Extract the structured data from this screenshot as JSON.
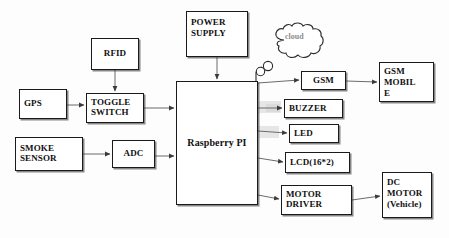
{
  "diagram": {
    "type": "block-diagram",
    "colors": {
      "stroke": "#1a1a1a",
      "wire": "#6b6b6b",
      "cloud_text": "#8d8d8d",
      "background": "#ffffff"
    },
    "nodes": [
      {
        "id": "gps",
        "label": "GPS",
        "x": 19,
        "y": 89,
        "w": 48,
        "h": 30,
        "font": 9,
        "align": "left"
      },
      {
        "id": "rfid",
        "label": "RFID",
        "x": 91,
        "y": 38,
        "w": 48,
        "h": 32,
        "font": 9,
        "align": "center"
      },
      {
        "id": "toggle",
        "label": "TOGGLE\nSWITCH",
        "x": 86,
        "y": 93,
        "w": 58,
        "h": 30,
        "font": 9,
        "align": "left"
      },
      {
        "id": "smoke",
        "label": "SMOKE\nSENSOR",
        "x": 15,
        "y": 137,
        "w": 68,
        "h": 34,
        "font": 9,
        "align": "left"
      },
      {
        "id": "adc",
        "label": "ADC",
        "x": 112,
        "y": 140,
        "w": 43,
        "h": 28,
        "font": 9,
        "align": "center"
      },
      {
        "id": "power",
        "label": "POWER\nSUPPLY",
        "x": 186,
        "y": 11,
        "w": 62,
        "h": 46,
        "font": 9,
        "align": "left"
      },
      {
        "id": "rpi",
        "label": "Raspberry PI",
        "x": 176,
        "y": 81,
        "w": 82,
        "h": 124,
        "font": 10,
        "align": "center"
      },
      {
        "id": "gsm",
        "label": "GSM",
        "x": 301,
        "y": 71,
        "w": 45,
        "h": 19,
        "font": 9,
        "align": "center"
      },
      {
        "id": "gsm_mobile",
        "label": "GSM\nMOBIL\nE",
        "x": 379,
        "y": 62,
        "w": 55,
        "h": 40,
        "font": 9,
        "align": "left"
      },
      {
        "id": "buzzer",
        "label": "BUZZER",
        "x": 284,
        "y": 99,
        "w": 59,
        "h": 19,
        "font": 9,
        "align": "left"
      },
      {
        "id": "led",
        "label": "LED",
        "x": 289,
        "y": 124,
        "w": 50,
        "h": 19,
        "font": 9,
        "align": "left"
      },
      {
        "id": "lcd",
        "label": "LCD(16*2)",
        "x": 285,
        "y": 152,
        "w": 65,
        "h": 21,
        "font": 9,
        "align": "left"
      },
      {
        "id": "motor_driver",
        "label": "MOTOR\nDRIVER",
        "x": 281,
        "y": 185,
        "w": 71,
        "h": 30,
        "font": 9,
        "align": "left"
      },
      {
        "id": "dc_motor",
        "label": "DC\nMOTOR\n(Vehicle)",
        "x": 382,
        "y": 172,
        "w": 50,
        "h": 46,
        "font": 9,
        "align": "left"
      }
    ],
    "cloud": {
      "label": "cloud",
      "x": 271,
      "y": 26,
      "w": 54,
      "h": 37,
      "text_x": 285,
      "text_y": 38,
      "font": 8
    },
    "antenna": {
      "label": "antenna-signal",
      "x": 253,
      "y": 64,
      "w": 22,
      "h": 20
    },
    "edges": [
      {
        "from": "gps",
        "to": "toggle",
        "arrow": true
      },
      {
        "from": "rfid",
        "to": "toggle",
        "arrow": true
      },
      {
        "from": "toggle",
        "to": "rpi",
        "arrow": true
      },
      {
        "from": "smoke",
        "to": "adc",
        "arrow": true
      },
      {
        "from": "adc",
        "to": "rpi",
        "arrow": true
      },
      {
        "from": "power",
        "to": "rpi",
        "arrow": true
      },
      {
        "from": "rpi",
        "to": "gsm",
        "arrow": true
      },
      {
        "from": "gsm",
        "to": "gsm_mobile",
        "arrow": true
      },
      {
        "from": "rpi",
        "to": "buzzer",
        "arrow": true
      },
      {
        "from": "rpi",
        "to": "led",
        "arrow": true
      },
      {
        "from": "rpi",
        "to": "lcd",
        "arrow": true
      },
      {
        "from": "rpi",
        "to": "motor_driver",
        "arrow": true
      },
      {
        "from": "motor_driver",
        "to": "dc_motor",
        "arrow": true
      }
    ]
  }
}
